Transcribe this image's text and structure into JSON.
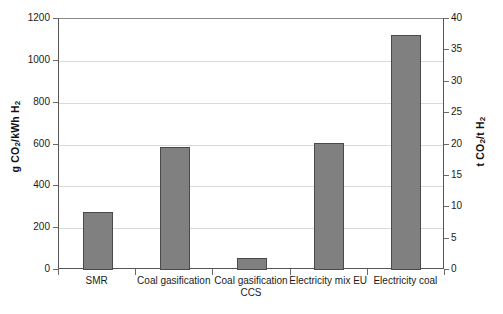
{
  "chart_data": {
    "type": "bar",
    "title": "",
    "categories": [
      "SMR",
      "Coal gasification",
      "Coal gasification CCS",
      "Electricity mix EU",
      "Electricity coal"
    ],
    "values": [
      275,
      590,
      55,
      605,
      1125
    ],
    "series": [
      {
        "name": "CO2 emissions per kWh H2",
        "values": [
          275,
          590,
          55,
          605,
          1125
        ]
      }
    ],
    "xlabel": "",
    "ylabel": "g CO2/kWh H2",
    "ylabel_secondary": "t CO2/t H2",
    "ylim": [
      0,
      1200
    ],
    "ylim_secondary": [
      0,
      40
    ],
    "yticks": [
      0,
      200,
      400,
      600,
      800,
      1000,
      1200
    ],
    "yticks_secondary": [
      0,
      5,
      10,
      15,
      20,
      25,
      30,
      35,
      40
    ],
    "grid": true,
    "legend": "none",
    "bar_color": "#808080",
    "bar_edge_color": "#4a4a4a"
  },
  "axes": {
    "left": {
      "title_prefix": "g CO",
      "title_sub1": "2",
      "title_mid": "/kWh H",
      "title_sub2": "2",
      "ticks": [
        "1200",
        "1000",
        "800",
        "600",
        "400",
        "200",
        "0"
      ]
    },
    "right": {
      "title_prefix": "t CO",
      "title_sub1": "2",
      "title_mid": "/t H",
      "title_sub2": "2",
      "ticks": [
        "40",
        "35",
        "30",
        "25",
        "20",
        "15",
        "10",
        "5",
        "0"
      ]
    }
  },
  "categories": [
    {
      "label_line1": "SMR",
      "label_line2": ""
    },
    {
      "label_line1": "Coal gasification",
      "label_line2": ""
    },
    {
      "label_line1": "Coal gasification",
      "label_line2": "CCS"
    },
    {
      "label_line1": "Electricity mix EU",
      "label_line2": ""
    },
    {
      "label_line1": "Electricity coal",
      "label_line2": ""
    }
  ]
}
